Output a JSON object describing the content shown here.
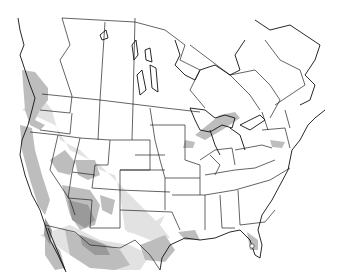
{
  "map": {
    "type": "species-range-map",
    "region": "North America",
    "colors": {
      "background": "#ffffff",
      "land": "#ffffff",
      "border": "#222222",
      "range_dark": "#9a9a9a",
      "range_medium": "#bdbdbd",
      "range_light": "#e2e2e2"
    },
    "legend": [],
    "marker": {
      "name": "point-marker",
      "location": "south Florida"
    }
  }
}
